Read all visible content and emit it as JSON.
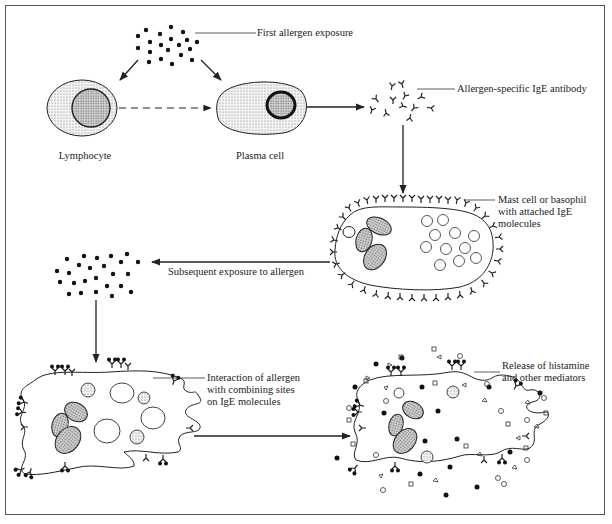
{
  "diagram": {
    "colors": {
      "ink": "#222222",
      "stipple": "#bdbdbd",
      "frame": "#555555",
      "background": "#ffffff"
    },
    "nodes": [
      {
        "id": "first_allergen",
        "label": "First allergen exposure"
      },
      {
        "id": "lymphocyte",
        "label": "Lymphocyte"
      },
      {
        "id": "plasma_cell",
        "label": "Plasma cell"
      },
      {
        "id": "ige_antibody",
        "label": "Allergen-specific IgE antibody"
      },
      {
        "id": "mast_cell",
        "label_lines": [
          "Mast cell or basophil",
          "with attached IgE",
          "molecules"
        ]
      },
      {
        "id": "subsequent_exposure",
        "label": "Subsequent exposure to allergen"
      },
      {
        "id": "interaction",
        "label_lines": [
          "Interaction of allergen",
          "with combining sites",
          "on IgE molecules"
        ]
      },
      {
        "id": "release",
        "label_lines": [
          "Release of histamine",
          "and other mediators"
        ]
      }
    ],
    "edges": [
      {
        "from": "first_allergen",
        "to": "lymphocyte",
        "style": "solid"
      },
      {
        "from": "first_allergen",
        "to": "plasma_cell",
        "style": "solid"
      },
      {
        "from": "lymphocyte",
        "to": "plasma_cell",
        "style": "dashed"
      },
      {
        "from": "plasma_cell",
        "to": "ige_antibody",
        "style": "solid"
      },
      {
        "from": "ige_antibody",
        "to": "mast_cell",
        "style": "solid"
      },
      {
        "from": "mast_cell",
        "to": "subsequent_exposure",
        "style": "solid"
      },
      {
        "from": "subsequent_exposure",
        "to": "interaction",
        "style": "solid"
      },
      {
        "from": "interaction",
        "to": "release",
        "style": "solid"
      }
    ]
  }
}
